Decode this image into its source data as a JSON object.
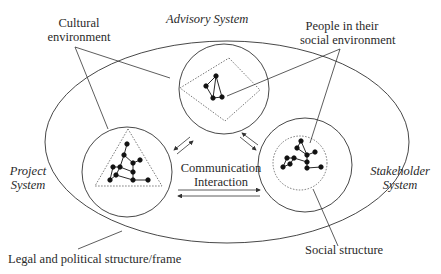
{
  "diagram": {
    "labels": {
      "advisory_system": "Advisory System",
      "project_system_line1": "Project",
      "project_system_line2": "System",
      "stakeholder_system_line1": "Stakeholder",
      "stakeholder_system_line2": "System",
      "cultural_environment_line1": "Cultural",
      "cultural_environment_line2": "environment",
      "people_line1": "People in their",
      "people_line2": "social environment",
      "communication_line1": "Communication",
      "communication_line2": "Interaction",
      "legal_frame": "Legal and political structure/frame",
      "social_structure": "Social structure"
    },
    "colors": {
      "stroke": "#333333",
      "text": "#2a2a2a",
      "background": "#ffffff"
    },
    "systems": [
      {
        "name": "Advisory System",
        "shape": "diamond"
      },
      {
        "name": "Project System",
        "shape": "triangle"
      },
      {
        "name": "Stakeholder System",
        "shape": "circle"
      }
    ]
  }
}
